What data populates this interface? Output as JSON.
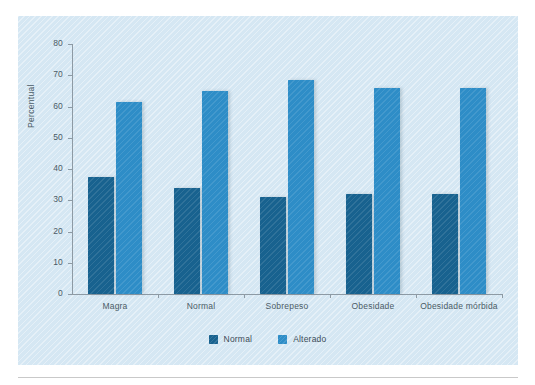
{
  "chart_data": {
    "type": "bar",
    "title": "",
    "xlabel": "",
    "ylabel": "Percentual",
    "ylim": [
      0,
      80
    ],
    "yticks": [
      0,
      10,
      20,
      30,
      40,
      50,
      60,
      70,
      80
    ],
    "ytick_labels": [
      "0",
      "10",
      "20",
      "30",
      "40",
      "50",
      "60",
      "70",
      "80"
    ],
    "grid": false,
    "legend_position": "bottom-center",
    "categories": [
      "Magra",
      "Normal",
      "Sobrepeso",
      "Obesidade",
      "Obesidade mórbida"
    ],
    "series": [
      {
        "name": "Normal",
        "color": "#18628f",
        "values": [
          37.5,
          34,
          31,
          32,
          32
        ]
      },
      {
        "name": "Alterado",
        "color": "#2e8dc7",
        "values": [
          61.5,
          65,
          68.5,
          66,
          66
        ]
      }
    ]
  },
  "figure": {
    "panel_color": "#d5e7f3",
    "axis_color": "#8d9aa4",
    "text_color": "#4b5b66"
  }
}
